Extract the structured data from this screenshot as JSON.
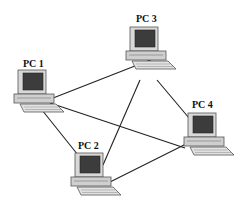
{
  "diagram": {
    "nodes": [
      {
        "id": "pc1",
        "label": "PC 1"
      },
      {
        "id": "pc2",
        "label": "PC 2"
      },
      {
        "id": "pc3",
        "label": "PC 3"
      },
      {
        "id": "pc4",
        "label": "PC 4"
      }
    ],
    "edges": [
      [
        "pc1",
        "pc2"
      ],
      [
        "pc1",
        "pc3"
      ],
      [
        "pc1",
        "pc4"
      ],
      [
        "pc2",
        "pc3"
      ],
      [
        "pc2",
        "pc4"
      ],
      [
        "pc3",
        "pc4"
      ]
    ]
  }
}
